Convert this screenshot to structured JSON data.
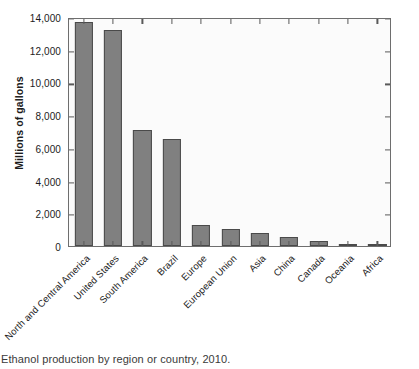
{
  "chart_data": {
    "type": "bar",
    "title": "",
    "caption": "Ethanol production by region or country, 2010.",
    "xlabel": "",
    "ylabel": "Millions of gallons",
    "ylim": [
      0,
      14000
    ],
    "ytick_values": [
      0,
      2000,
      4000,
      6000,
      8000,
      10000,
      12000,
      14000
    ],
    "ytick_labels": [
      "0",
      "2,000",
      "4,000",
      "6,000",
      "8,000",
      "10,000",
      "12,000",
      "14,000"
    ],
    "grid": false,
    "legend": null,
    "bar_color": "#808080",
    "bar_edge_color": "#4a4a4a",
    "categories": [
      "North and Central America",
      "United States",
      "South America",
      "Brazil",
      "Europe",
      "European Union",
      "Asia",
      "China",
      "Canada",
      "Oceania",
      "Africa"
    ],
    "values": [
      13700,
      13200,
      7100,
      6550,
      1300,
      1050,
      800,
      550,
      300,
      70,
      50
    ]
  }
}
